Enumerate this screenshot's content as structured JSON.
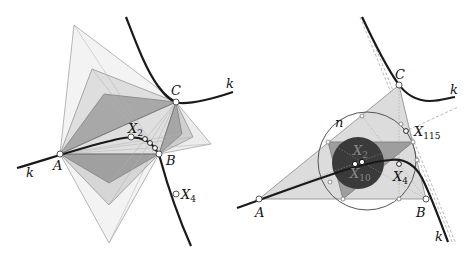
{
  "left_figure": {
    "curve_label": "k",
    "points": {
      "A": {
        "label": "A",
        "x": 60,
        "y": 154
      },
      "B": {
        "label": "B",
        "x": 159,
        "y": 154
      },
      "C": {
        "label": "C",
        "x": 176,
        "y": 102
      },
      "X2": {
        "label": "X",
        "sub": "2",
        "x": 131,
        "y": 137
      },
      "X4": {
        "label": "X",
        "sub": "4",
        "x": 176,
        "y": 194
      }
    },
    "polygon_fill_colors": [
      "#e8e8e8",
      "#d2d2d2",
      "#b8b8b8",
      "#9a9a9a"
    ]
  },
  "right_figure": {
    "curve_label": "k",
    "circle_label": "n",
    "points": {
      "A": {
        "label": "A",
        "x": 259,
        "y": 199
      },
      "B": {
        "label": "B",
        "x": 426,
        "y": 199
      },
      "C": {
        "label": "C",
        "x": 399,
        "y": 85
      },
      "X4": {
        "label": "X",
        "sub": "4",
        "x": 399,
        "y": 164
      },
      "X115": {
        "label": "X",
        "sub": "115",
        "x": 406,
        "y": 131
      },
      "X2": {
        "label": "X",
        "sub": "2"
      },
      "X10": {
        "label": "X",
        "sub": "10"
      }
    },
    "colors": {
      "triangle_fill": "#dcdcdc",
      "medial_fill": "#9e9e9e",
      "incircle_fill": "#3a3a3a",
      "curve": "#1a1a1a"
    }
  }
}
